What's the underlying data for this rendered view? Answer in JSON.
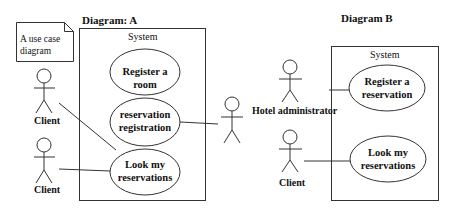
{
  "diagram_a": {
    "title": "Diagram: A",
    "note": "A use case\ndiagram",
    "system_label": "System",
    "use_cases": [
      {
        "label": "Register a room"
      },
      {
        "label": "reservation\nregistration"
      },
      {
        "label": "Look my\nreservations"
      }
    ],
    "actors": [
      {
        "label": "Client"
      },
      {
        "label": "Client"
      },
      {
        "label": ""
      }
    ]
  },
  "diagram_b": {
    "title": "Diagram B",
    "system_label": "System",
    "use_cases": [
      {
        "label": "Register a\nreservation"
      },
      {
        "label": "Look my\nreservations"
      }
    ],
    "actors": [
      {
        "label": "Hotel administrator"
      },
      {
        "label": "Client"
      }
    ]
  },
  "colors": {
    "stroke": "#333333",
    "background": "#ffffff"
  }
}
